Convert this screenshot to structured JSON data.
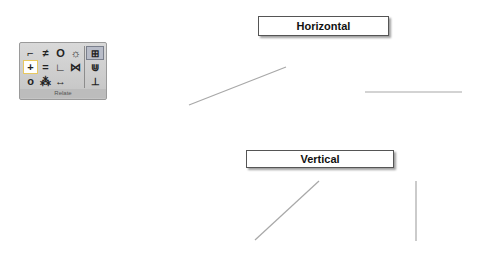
{
  "palette": {
    "title": "Relate",
    "tools": [
      {
        "name": "perpendicular-icon",
        "glyph": "⌐",
        "active": false
      },
      {
        "name": "parallel-icon",
        "glyph": "≠",
        "active": false
      },
      {
        "name": "concentric-icon",
        "glyph": "O",
        "active": false
      },
      {
        "name": "fix-icon",
        "glyph": "☼",
        "active": false
      },
      {
        "name": "horizontal-vertical-icon",
        "glyph": "+",
        "active": true
      },
      {
        "name": "equal-icon",
        "glyph": "=",
        "active": false
      },
      {
        "name": "tangent-icon",
        "glyph": "∟",
        "active": false
      },
      {
        "name": "symmetric-icon",
        "glyph": "⋈",
        "active": false
      },
      {
        "name": "coincident-icon",
        "glyph": "o",
        "active": false
      },
      {
        "name": "midpoint-icon",
        "glyph": "⁂",
        "active": false
      },
      {
        "name": "collinear-icon",
        "glyph": "↔",
        "active": false
      },
      {
        "name": "blank",
        "glyph": "",
        "active": false
      }
    ],
    "side_tools": [
      {
        "name": "relationship-handles-icon",
        "glyph": "⊞",
        "boxed": true
      },
      {
        "name": "maintain-relationships-icon",
        "glyph": "⋓",
        "boxed": false
      },
      {
        "name": "dimension-icon",
        "glyph": "⊥",
        "boxed": false
      }
    ]
  },
  "labels": {
    "horizontal": "Horizontal",
    "vertical": "Vertical"
  },
  "lines": [
    {
      "id": "horizontal-before",
      "x1": 189,
      "y1": 105,
      "x2": 286,
      "y2": 67
    },
    {
      "id": "horizontal-after",
      "x1": 365,
      "y1": 92,
      "x2": 462,
      "y2": 92
    },
    {
      "id": "vertical-before",
      "x1": 255,
      "y1": 240,
      "x2": 319,
      "y2": 181
    },
    {
      "id": "vertical-after",
      "x1": 416,
      "y1": 181,
      "x2": 416,
      "y2": 241
    }
  ],
  "colors": {
    "line": "#a8a8a8"
  }
}
